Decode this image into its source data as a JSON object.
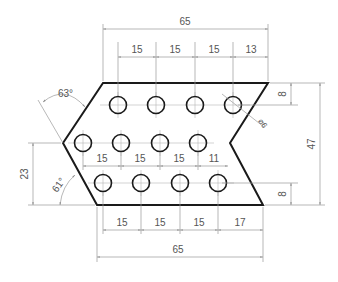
{
  "drawing": {
    "type": "engineering drawing - perforated chevron plate",
    "colors": {
      "outline": "#1a1a1a",
      "dimension": "#9a9a9a",
      "text": "#555555",
      "background": "#ffffff"
    },
    "dimensions": {
      "top_overall": "65",
      "top_spacing": [
        "15",
        "15",
        "15",
        "13"
      ],
      "middle_spacing": [
        "15",
        "15",
        "15",
        "11"
      ],
      "bottom_spacing": [
        "15",
        "15",
        "15",
        "17"
      ],
      "bottom_overall": "65",
      "right_top_offset": "8",
      "right_bottom_offset": "8",
      "right_height": "47",
      "left_height": "23",
      "angle_top": "63°",
      "angle_bottom": "61°",
      "hole_diameter": "⌀6"
    },
    "holes": {
      "row_top": [
        118,
        156,
        195,
        233
      ],
      "row_middle": [
        83,
        121,
        160,
        198
      ],
      "row_bottom": [
        103,
        141,
        180,
        218
      ],
      "radius": 8.5
    }
  }
}
